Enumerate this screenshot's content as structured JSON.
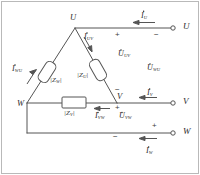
{
  "diagram": {
    "type": "electrical-schematic",
    "stroke_color": "#555555",
    "text_color": "#2b2b2b",
    "background": "#ffffff"
  },
  "nodes": {
    "u_vertex": "U",
    "v_vertex": "V",
    "w_vertex": "W"
  },
  "terminals": [
    {
      "label": "U",
      "y": 30
    },
    {
      "label": "V",
      "y": 100
    },
    {
      "label": "W",
      "y": 130
    }
  ],
  "impedances": [
    {
      "name": "Z_w",
      "base": "Z",
      "sub": "W",
      "open": "|",
      "close": "|"
    },
    {
      "name": "Z_u",
      "base": "Z",
      "sub": "U",
      "open": "|",
      "close": "|"
    },
    {
      "name": "Z_v",
      "base": "Z",
      "sub": "V",
      "open": "|",
      "close": "|"
    }
  ],
  "line_currents": [
    {
      "name": "I_U",
      "base": "I",
      "sub": "U",
      "direction": "left"
    },
    {
      "name": "I_V",
      "base": "I",
      "sub": "V",
      "direction": "left"
    },
    {
      "name": "I_W",
      "base": "I",
      "sub": "W",
      "direction": "left"
    }
  ],
  "phase_currents": [
    {
      "name": "I_WU",
      "base": "I",
      "sub": "WU",
      "direction": "up-right"
    },
    {
      "name": "I_UV",
      "base": "I",
      "sub": "UV",
      "direction": "down-right"
    },
    {
      "name": "I_VW",
      "base": "I",
      "sub": "VW",
      "direction": "left"
    }
  ],
  "voltages": [
    {
      "name": "U_UV",
      "base": "U",
      "sub": "UV"
    },
    {
      "name": "U_WU",
      "base": "U",
      "sub": "WU"
    },
    {
      "name": "U_VW",
      "base": "U",
      "sub": "VW"
    }
  ],
  "polarity_marks": [
    {
      "sign": "+",
      "at": "u-line-left"
    },
    {
      "sign": "−",
      "at": "u-line-right"
    },
    {
      "sign": "−",
      "at": "v-node-above"
    },
    {
      "sign": "+",
      "at": "v-node-below"
    },
    {
      "sign": "−",
      "at": "w-line-left"
    },
    {
      "sign": "+",
      "at": "w-line-right"
    }
  ]
}
